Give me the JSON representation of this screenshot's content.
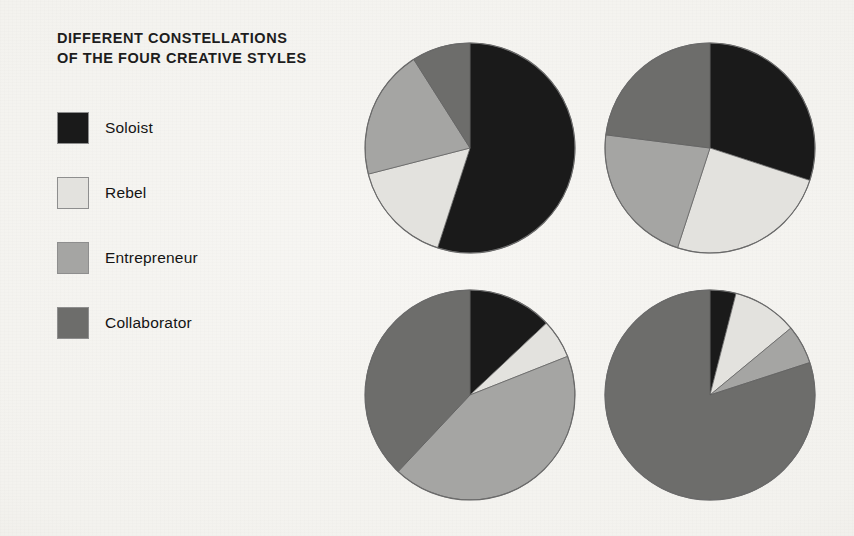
{
  "title": {
    "line1": "DIFFERENT CONSTELLATIONS",
    "line2": "OF THE FOUR CREATIVE STYLES"
  },
  "legend": {
    "items": [
      {
        "label": "Soloist",
        "color": "#1a1a1a",
        "swatch_icon": "legend-swatch-soloist"
      },
      {
        "label": "Rebel",
        "color": "#e3e2de",
        "swatch_icon": "legend-swatch-rebel"
      },
      {
        "label": "Entrepreneur",
        "color": "#a5a5a3",
        "swatch_icon": "legend-swatch-entrepreneur"
      },
      {
        "label": "Collaborator",
        "color": "#6d6d6b",
        "swatch_icon": "legend-swatch-collaborator"
      }
    ]
  },
  "chart_data": {
    "type": "pie",
    "title": "DIFFERENT CONSTELLATIONS OF THE FOUR CREATIVE STYLES",
    "xlabel": "",
    "ylabel": "",
    "grid": false,
    "legend_position": "left",
    "categories": [
      "Soloist",
      "Rebel",
      "Entrepreneur",
      "Collaborator"
    ],
    "colors": [
      "#1a1a1a",
      "#e3e2de",
      "#a5a5a3",
      "#6d6d6b"
    ],
    "start_angle_deg": 0,
    "direction": "clockwise",
    "units": "percent",
    "charts": [
      {
        "name": "constellation-1",
        "position": "top-left",
        "center": [
          470,
          148
        ],
        "radius": 105,
        "values": [
          55,
          16,
          20,
          9
        ],
        "slices": [
          {
            "label": "Soloist",
            "value": 55
          },
          {
            "label": "Rebel",
            "value": 16
          },
          {
            "label": "Entrepreneur",
            "value": 20
          },
          {
            "label": "Collaborator",
            "value": 9
          }
        ]
      },
      {
        "name": "constellation-2",
        "position": "top-right",
        "center": [
          710,
          148
        ],
        "radius": 105,
        "values": [
          30,
          25,
          22,
          23
        ],
        "slices": [
          {
            "label": "Soloist",
            "value": 30
          },
          {
            "label": "Rebel",
            "value": 25
          },
          {
            "label": "Entrepreneur",
            "value": 22
          },
          {
            "label": "Collaborator",
            "value": 23
          }
        ]
      },
      {
        "name": "constellation-3",
        "position": "bottom-left",
        "center": [
          470,
          395
        ],
        "radius": 105,
        "values": [
          13,
          6,
          43,
          38
        ],
        "slices": [
          {
            "label": "Soloist",
            "value": 13
          },
          {
            "label": "Rebel",
            "value": 6
          },
          {
            "label": "Entrepreneur",
            "value": 43
          },
          {
            "label": "Collaborator",
            "value": 38
          }
        ]
      },
      {
        "name": "constellation-4",
        "position": "bottom-right",
        "center": [
          710,
          395
        ],
        "radius": 105,
        "values": [
          4,
          10,
          6,
          80
        ],
        "slices": [
          {
            "label": "Soloist",
            "value": 4
          },
          {
            "label": "Rebel",
            "value": 10
          },
          {
            "label": "Entrepreneur",
            "value": 6
          },
          {
            "label": "Collaborator",
            "value": 80
          }
        ]
      }
    ]
  }
}
